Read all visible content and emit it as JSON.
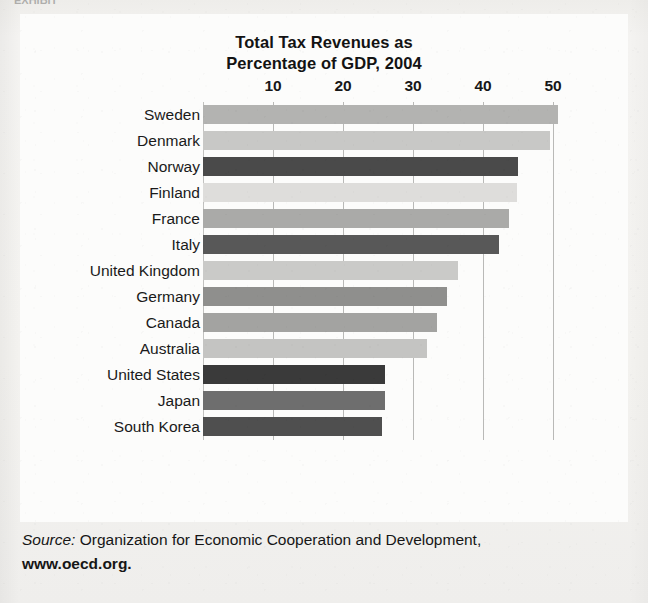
{
  "figure": {
    "top_sliver_text": "EXHIBIT",
    "title_line1": "Total Tax Revenues as",
    "title_line2": "Percentage of GDP, 2004"
  },
  "source": {
    "label": "Source:",
    "text": " Organization for Economic Cooperation and Development,",
    "url": "www.oecd.org."
  },
  "chart_data": {
    "type": "bar",
    "orientation": "horizontal",
    "title": "Total Tax Revenues as Percentage of GDP, 2004",
    "xlabel": "",
    "ylabel": "",
    "xlim": [
      0,
      53
    ],
    "xticks": [
      10,
      20,
      30,
      40,
      50
    ],
    "xtick_labels": [
      "10",
      "20",
      "30",
      "40",
      "50"
    ],
    "grid": true,
    "legend": "none",
    "value_unit": "percent of GDP",
    "categories": [
      "Sweden",
      "Denmark",
      "Norway",
      "Finland",
      "France",
      "Italy",
      "United Kingdom",
      "Germany",
      "Canada",
      "Australia",
      "United States",
      "Japan",
      "South Korea"
    ],
    "values": [
      50.7,
      49.6,
      45.0,
      44.8,
      43.7,
      42.3,
      36.4,
      34.9,
      33.4,
      32.0,
      26.0,
      26.0,
      25.5
    ],
    "bar_colors": [
      "#b3b3b1",
      "#c8c8c6",
      "#4a4a4a",
      "#dedddb",
      "#aaaaa8",
      "#585858",
      "#cacac8",
      "#8f8f8d",
      "#a3a3a1",
      "#c4c4c2",
      "#3a3a3a",
      "#6e6e6e",
      "#4f4f4f"
    ],
    "bars": [
      {
        "category": "Sweden",
        "value": 50.7,
        "color": "#b3b3b1"
      },
      {
        "category": "Denmark",
        "value": 49.6,
        "color": "#c8c8c6"
      },
      {
        "category": "Norway",
        "value": 45.0,
        "color": "#4a4a4a"
      },
      {
        "category": "Finland",
        "value": 44.8,
        "color": "#dedddb"
      },
      {
        "category": "France",
        "value": 43.7,
        "color": "#aaaaa8"
      },
      {
        "category": "Italy",
        "value": 42.3,
        "color": "#585858"
      },
      {
        "category": "United Kingdom",
        "value": 36.4,
        "color": "#cacac8"
      },
      {
        "category": "Germany",
        "value": 34.9,
        "color": "#8f8f8d"
      },
      {
        "category": "Canada",
        "value": 33.4,
        "color": "#a3a3a1"
      },
      {
        "category": "Australia",
        "value": 32.0,
        "color": "#c4c4c2"
      },
      {
        "category": "United States",
        "value": 26.0,
        "color": "#3a3a3a"
      },
      {
        "category": "Japan",
        "value": 26.0,
        "color": "#6e6e6e"
      },
      {
        "category": "South Korea",
        "value": 25.5,
        "color": "#4f4f4f"
      }
    ]
  }
}
